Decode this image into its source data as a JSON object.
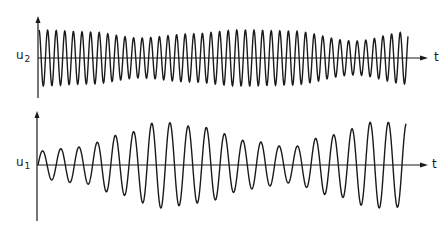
{
  "figure": {
    "top_plot": {
      "ylabel": "u",
      "ylabel_subscript": "2",
      "xlabel": "t",
      "axis_origin": {
        "x": 38,
        "y": 58
      },
      "y_axis_range_px": [
        16,
        98
      ],
      "x_axis_end_px": 428,
      "wave": {
        "x_start": 39,
        "x_end": 408,
        "period_px": 8.6,
        "phase": 1.57,
        "envelope": [
          [
            39,
            28
          ],
          [
            90,
            26
          ],
          [
            140,
            20
          ],
          [
            190,
            24
          ],
          [
            240,
            28
          ],
          [
            290,
            27
          ],
          [
            355,
            17
          ],
          [
            408,
            26
          ]
        ]
      }
    },
    "bottom_plot": {
      "ylabel": "u",
      "ylabel_subscript": "1",
      "xlabel": "t",
      "axis_origin": {
        "x": 37,
        "y": 165
      },
      "y_axis_range_px": [
        111,
        221
      ],
      "x_axis_end_px": 428,
      "wave": {
        "x_start": 38,
        "x_end": 406,
        "period_px": 18.2,
        "phase": 0.0,
        "envelope": [
          [
            38,
            14
          ],
          [
            80,
            18
          ],
          [
            120,
            30
          ],
          [
            160,
            43
          ],
          [
            200,
            38
          ],
          [
            250,
            24
          ],
          [
            290,
            18
          ],
          [
            330,
            30
          ],
          [
            375,
            43
          ],
          [
            406,
            42
          ]
        ]
      }
    },
    "line_color": "#1a1a1a"
  }
}
